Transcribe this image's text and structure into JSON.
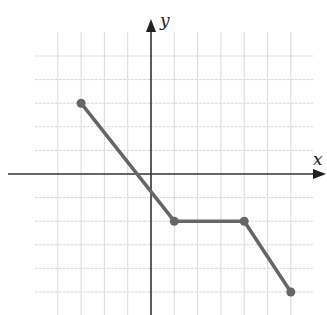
{
  "chart_data": {
    "type": "line",
    "title": "",
    "xlabel": "x",
    "ylabel": "y",
    "grid": true,
    "legend": null,
    "xlim": [
      -5,
      7
    ],
    "ylim": [
      -6,
      6
    ],
    "x": [
      -3,
      1,
      4,
      6
    ],
    "y": [
      3,
      -2,
      -2,
      -5
    ],
    "series": [
      {
        "name": "piecewise",
        "points": [
          [
            -3,
            3
          ],
          [
            1,
            -2
          ],
          [
            4,
            -2
          ],
          [
            6,
            -5
          ]
        ],
        "markers": "closed-circle"
      }
    ],
    "colors": {
      "line": "#666666",
      "axis": "#333333",
      "grid": "#d9d9d9"
    }
  },
  "labels": {
    "x_axis": "x",
    "y_axis": "y"
  }
}
